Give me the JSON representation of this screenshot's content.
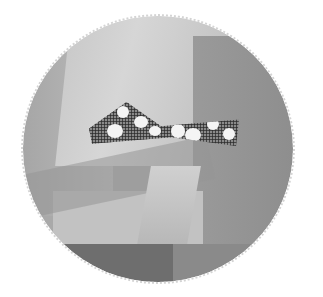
{
  "image": {
    "description": "Circular grayscale photo with a scalloped edge showing draped tulle fabric with a small plaid polka-dot bow",
    "shape": "circle",
    "palette": {
      "background": "#ffffff",
      "fabric_light": "#d0d0d0",
      "fabric_mid": "#a9a9a9",
      "fabric_dark": "#6e6e6e",
      "bow_dots": "#f4f4f4"
    },
    "elements": [
      "tulle-fabric",
      "plaid-bow",
      "white-polka-dots",
      "dark-box-base"
    ]
  }
}
